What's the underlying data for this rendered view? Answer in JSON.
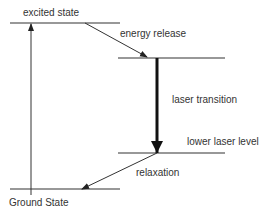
{
  "diagram": {
    "labels": {
      "excited_state": "excited state",
      "energy_release": "energy release",
      "laser_transition": "laser transition",
      "lower_laser_level": "lower laser level",
      "relaxation": "relaxation",
      "ground_state": "Ground State"
    },
    "levels": [
      {
        "name": "excited state",
        "y": 23,
        "x1": 10,
        "x2": 120
      },
      {
        "name": "upper laser level",
        "y": 58,
        "x1": 118,
        "x2": 225
      },
      {
        "name": "lower laser level",
        "y": 153,
        "x1": 118,
        "x2": 225
      },
      {
        "name": "ground state",
        "y": 189,
        "x1": 10,
        "x2": 120
      }
    ],
    "colors": {
      "line": "#222222",
      "text": "#333333",
      "background": "#ffffff"
    }
  }
}
